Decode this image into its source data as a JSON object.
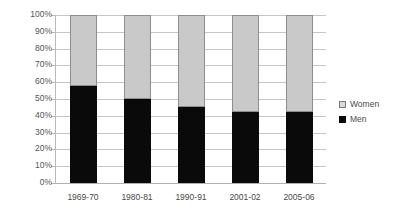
{
  "chart_data": {
    "type": "bar",
    "subtype": "stacked-percentage",
    "title": "",
    "xlabel": "",
    "ylabel": "",
    "ylim": [
      0,
      100
    ],
    "y_tick_labels": [
      "100%",
      "90%",
      "80%",
      "70%",
      "60%",
      "50%",
      "40%",
      "30%",
      "20%",
      "10%",
      "0%"
    ],
    "y_tick_values": [
      100,
      90,
      80,
      70,
      60,
      50,
      40,
      30,
      20,
      10,
      0
    ],
    "grid": true,
    "legend_position": "right",
    "categories": [
      "1969-70",
      "1980-81",
      "1990-91",
      "2001-02",
      "2005-06"
    ],
    "series": [
      {
        "name": "Women",
        "color": "#c9c9c9",
        "values": [
          42,
          50,
          54.5,
          57.5,
          58
        ]
      },
      {
        "name": "Men",
        "color": "#0a0a0a",
        "values": [
          58,
          50,
          45.5,
          42.5,
          42
        ]
      }
    ]
  },
  "legend": {
    "items": [
      {
        "label": "Women",
        "swatch": "light-gray-square"
      },
      {
        "label": "Men",
        "swatch": "black-square"
      }
    ]
  }
}
